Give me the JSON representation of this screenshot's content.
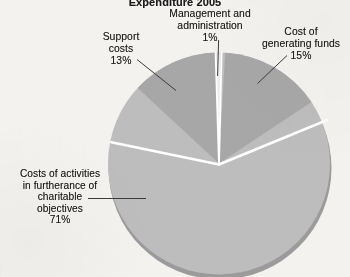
{
  "chart_data": {
    "type": "pie",
    "title": "Expenditure 2005",
    "xlabel": "",
    "ylabel": "",
    "units": "percent",
    "legend_position": "none",
    "grid": false,
    "categories": [
      "Costs of activities in furtherance of charitable objectives",
      "Cost of generating funds",
      "Support costs",
      "Management and administration"
    ],
    "values": [
      71,
      15,
      13,
      1
    ],
    "labels": [
      "Costs of activities in furtherance of charitable objectives 71%",
      "Cost of generating funds 15%",
      "Support costs 13%",
      "Management and administration 1%"
    ],
    "colors": [
      "#bdbdbd",
      "#a7a7a7",
      "#a7a7a7",
      "#ededed"
    ],
    "slices": [
      {
        "name": "charitable-objectives",
        "label": "Costs of activities in furtherance of charitable objectives",
        "value": 71,
        "display_value": "71%",
        "color": "#bdbdbd"
      },
      {
        "name": "cost-of-generating-funds",
        "label": "Cost of generating funds",
        "value": 15,
        "display_value": "15%",
        "color": "#a7a7a7"
      },
      {
        "name": "support-costs",
        "label": "Support costs",
        "value": 13,
        "display_value": "13%",
        "color": "#a7a7a7"
      },
      {
        "name": "management-and-administration",
        "label": "Management and administration",
        "value": 1,
        "display_value": "1%",
        "color": "#ededed"
      }
    ]
  },
  "chart": {
    "title": "Expenditure 2005",
    "labels": {
      "management": {
        "line1": "Management and",
        "line2": "administration",
        "value": "1%"
      },
      "support": {
        "line1": "Support",
        "line2": "costs",
        "value": "13%"
      },
      "generating_funds": {
        "line1": "Cost of",
        "line2": "generating funds",
        "value": "15%"
      },
      "charitable": {
        "line1": "Costs of activities",
        "line2": "in furtherance of",
        "line3": "charitable",
        "line4": "objectives",
        "value": "71%"
      }
    }
  },
  "colors": {
    "background": "#f3f2ef",
    "slice_light": "#bdbdbd",
    "slice_dark": "#a7a7a7",
    "slice_sliver": "#ededed",
    "shadow": "#9a9a9a",
    "separator": "#ffffff",
    "leader_line": "#3c3c3c",
    "text": "#171717"
  }
}
